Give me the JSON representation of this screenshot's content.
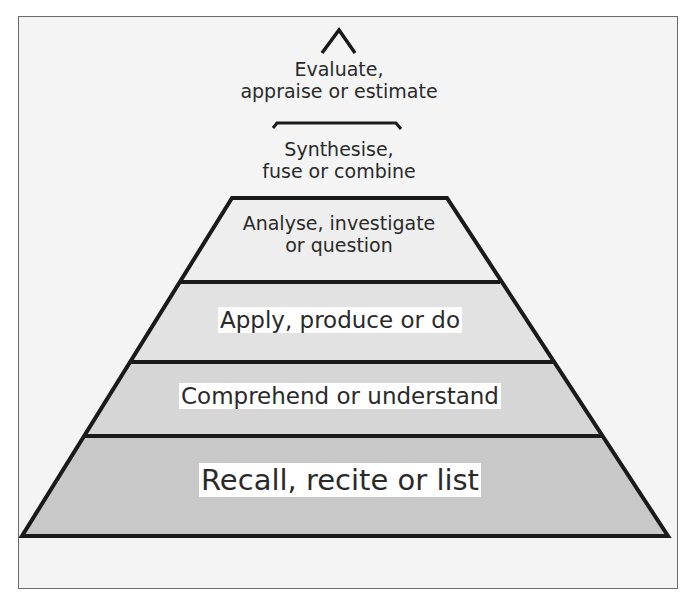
{
  "diagram": {
    "title": "",
    "type": "pyramid",
    "levels": [
      {
        "id": "evaluate",
        "line1": "Evaluate,",
        "line2": "appraise or estimate",
        "fill": "#f4f4f4"
      },
      {
        "id": "synthesise",
        "line1": "Synthesise,",
        "line2": "fuse or combine",
        "fill": "#f4f4f4"
      },
      {
        "id": "analyse",
        "line1": "Analyse, investigate",
        "line2": "or question",
        "fill": "#eeeeee"
      },
      {
        "id": "apply",
        "line1": "Apply, produce or do",
        "fill": "#e2e2e2"
      },
      {
        "id": "comprehend",
        "line1": "Comprehend or understand",
        "fill": "#d6d6d6"
      },
      {
        "id": "recall",
        "line1": "Recall, recite or list",
        "fill": "#c8c8c8"
      }
    ],
    "colors": {
      "outline": "#1a1a1a",
      "background": "#f4f4f4",
      "frame": "#6a6a6a",
      "text": "#2a2a2a",
      "label_highlight": "#ffffff"
    }
  }
}
